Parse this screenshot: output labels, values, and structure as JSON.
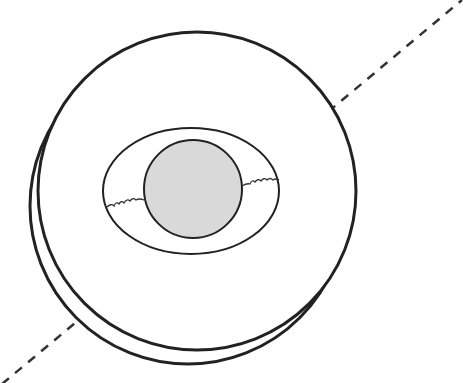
{
  "diagram": {
    "colors": {
      "background": "#ffffff",
      "stroke": "#222222",
      "inner_fill": "#d9d9d9"
    },
    "axis_line": {
      "style": "dashed",
      "from": [
        0,
        383
      ],
      "to": [
        463,
        0
      ]
    },
    "outer_circles": [
      {
        "cx": 197,
        "cy": 191,
        "r": 158
      },
      {
        "cx": 188,
        "cy": 205,
        "r": 158
      }
    ],
    "ellipse": {
      "cx": 191,
      "cy": 191,
      "rx": 88,
      "ry": 63
    },
    "inner_circle": {
      "cx": 191,
      "cy": 188,
      "r": 48,
      "fill": "#d9d9d9"
    },
    "connectors": [
      {
        "side": "left",
        "style": "wavy"
      },
      {
        "side": "right",
        "style": "wavy"
      }
    ],
    "labels": []
  }
}
